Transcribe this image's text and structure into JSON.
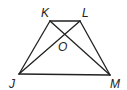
{
  "figure": {
    "type": "trapezoid with diagonals",
    "vertices": {
      "K": {
        "label": "K"
      },
      "L": {
        "label": "L"
      },
      "J": {
        "label": "J"
      },
      "M": {
        "label": "M"
      }
    },
    "intersection": {
      "label": "O"
    },
    "segments": [
      "KL",
      "LM",
      "MJ",
      "JK",
      "KM",
      "LJ"
    ]
  }
}
